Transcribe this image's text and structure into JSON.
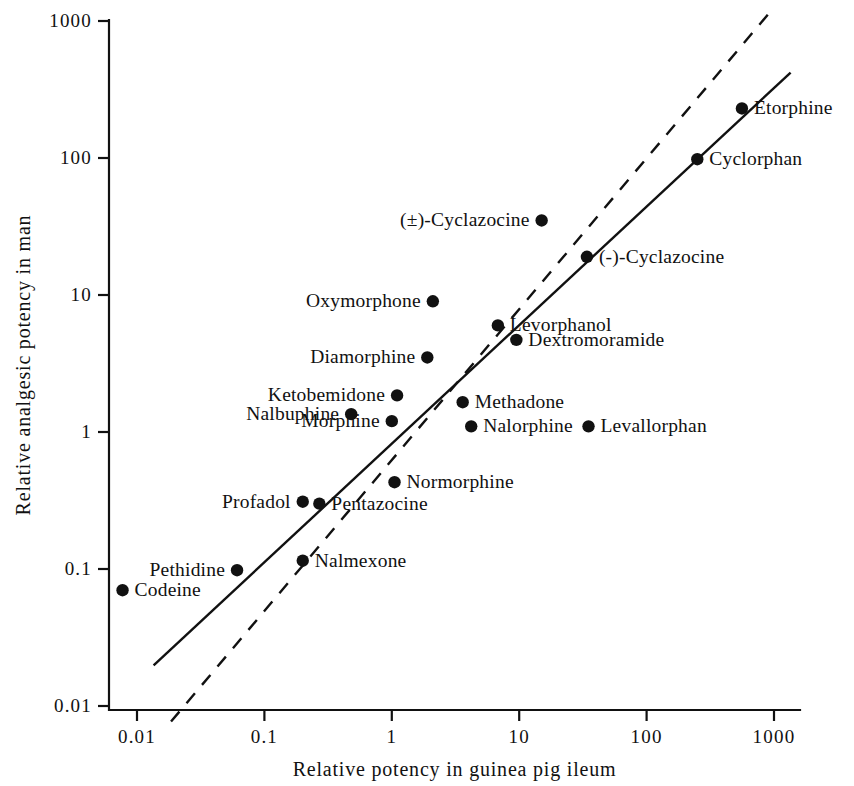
{
  "chart_data": {
    "type": "scatter",
    "title": "",
    "xlabel": "Relative potency in guinea pig ileum",
    "ylabel": "Relative analgesic potency in man",
    "xscale": "log",
    "yscale": "log",
    "xlim": [
      0.005,
      2200
    ],
    "ylim": [
      0.0055,
      1600
    ],
    "grid": false,
    "legend": "none",
    "xticks": [
      "0.01",
      "0.1",
      "1",
      "10",
      "100",
      "1000"
    ],
    "xtick_values": [
      0.01,
      0.1,
      1,
      10,
      100,
      1000
    ],
    "yticks": [
      "0.01",
      "0.1",
      "1",
      "10",
      "100",
      "1000"
    ],
    "ytick_values": [
      0.01,
      0.1,
      1,
      10,
      100,
      1000
    ],
    "points": [
      {
        "name": "Etorphine",
        "x": 560,
        "y": 230,
        "label": "Etorphine",
        "side": "right"
      },
      {
        "name": "Cyclorphan",
        "x": 250,
        "y": 98,
        "label": "Cyclorphan",
        "side": "right"
      },
      {
        "name": "(±)-Cyclazocine",
        "x": 15,
        "y": 35,
        "label": "(±)-Cyclazocine",
        "side": "left"
      },
      {
        "name": "(-)-Cyclazocine",
        "x": 34,
        "y": 19,
        "label": "(-)-Cyclazocine",
        "side": "right"
      },
      {
        "name": "Oxymorphone",
        "x": 2.1,
        "y": 9.0,
        "label": "Oxymorphone",
        "side": "left"
      },
      {
        "name": "Levorphanol",
        "x": 6.8,
        "y": 6.0,
        "label": "Levorphanol",
        "side": "right"
      },
      {
        "name": "Dextromoramide",
        "x": 9.5,
        "y": 4.7,
        "label": "Dextromoramide",
        "side": "right"
      },
      {
        "name": "Diamorphine",
        "x": 1.9,
        "y": 3.5,
        "label": "Diamorphine",
        "side": "left"
      },
      {
        "name": "Ketobemidone",
        "x": 1.1,
        "y": 1.85,
        "label": "Ketobemidone",
        "side": "left"
      },
      {
        "name": "Methadone",
        "x": 3.6,
        "y": 1.65,
        "label": "Methadone",
        "side": "right"
      },
      {
        "name": "Nalbuphine",
        "x": 0.48,
        "y": 1.35,
        "label": "Nalbuphine",
        "side": "left"
      },
      {
        "name": "Morphine",
        "x": 1.0,
        "y": 1.2,
        "label": "Morphine",
        "side": "left"
      },
      {
        "name": "Nalorphine",
        "x": 4.2,
        "y": 1.1,
        "label": "Nalorphine",
        "side": "right"
      },
      {
        "name": "Levallorphan",
        "x": 35,
        "y": 1.1,
        "label": "Levallorphan",
        "side": "right"
      },
      {
        "name": "Normorphine",
        "x": 1.05,
        "y": 0.43,
        "label": "Normorphine",
        "side": "right"
      },
      {
        "name": "Profadol",
        "x": 0.2,
        "y": 0.31,
        "label": "Profadol",
        "side": "left"
      },
      {
        "name": "Pentazocine",
        "x": 0.27,
        "y": 0.3,
        "label": "Pentazocine",
        "side": "right"
      },
      {
        "name": "Nalmexone",
        "x": 0.2,
        "y": 0.115,
        "label": "Nalmexone",
        "side": "right"
      },
      {
        "name": "Pethidine",
        "x": 0.061,
        "y": 0.098,
        "label": "Pethidine",
        "side": "left"
      },
      {
        "name": "Codeine",
        "x": 0.0077,
        "y": 0.07,
        "label": "Codeine",
        "side": "right"
      }
    ],
    "lines": [
      {
        "name": "regression-line",
        "style": "solid",
        "x1": 0.0135,
        "y1": 0.0198,
        "x2": 1350,
        "y2": 420
      },
      {
        "name": "identity-line",
        "style": "dashed",
        "x1": 0.0185,
        "y1": 0.0077,
        "x2": 900,
        "y2": 1120
      }
    ]
  },
  "figure": {
    "marker_color": "#111111",
    "axis_color": "#111111",
    "background": "#ffffff"
  }
}
